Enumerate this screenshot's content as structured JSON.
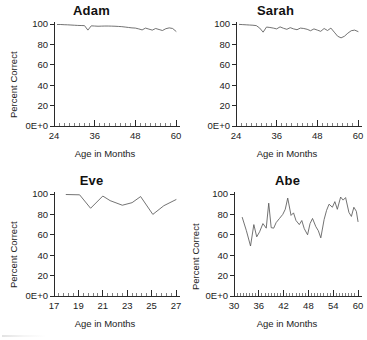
{
  "figure": {
    "title": "",
    "panel_count": 4
  },
  "chart_data": [
    {
      "type": "line",
      "title": "Adam",
      "xlabel": "Age in Months",
      "ylabel": "Percent Correct",
      "xlim": [
        24,
        60
      ],
      "ylim": [
        0,
        100
      ],
      "xticks": [
        24,
        36,
        48,
        60
      ],
      "xtick_labels": [
        "24",
        "36",
        "48",
        "60"
      ],
      "yticks": [
        0,
        20,
        40,
        60,
        80,
        100
      ],
      "ytick_labels": [
        "0E+0",
        "20",
        "40",
        "60",
        "80",
        "100"
      ],
      "x_minor_step": 1.5,
      "grid": false,
      "legend": "none",
      "x": [
        25,
        26,
        27,
        28,
        29,
        30,
        31,
        32,
        33,
        34,
        35,
        36,
        37,
        38,
        39,
        40,
        41,
        42,
        43,
        44,
        45,
        46,
        47,
        48,
        49,
        50,
        51,
        52,
        53,
        54,
        55,
        56,
        57,
        58,
        59,
        60
      ],
      "y": [
        99.5,
        99.5,
        99.3,
        99.2,
        99.0,
        98.8,
        98.6,
        98.5,
        98.4,
        94.0,
        98.2,
        98.0,
        97.8,
        97.9,
        98.0,
        98.0,
        97.9,
        97.8,
        97.6,
        97.4,
        97.0,
        96.6,
        96.2,
        96.0,
        95.2,
        94.2,
        96.0,
        95.0,
        94.0,
        95.6,
        94.6,
        93.6,
        95.4,
        96.2,
        95.6,
        92.8
      ],
      "series_name": "Adam"
    },
    {
      "type": "line",
      "title": "Sarah",
      "xlabel": "Age in Months",
      "ylabel": "",
      "xlim": [
        24,
        60
      ],
      "ylim": [
        0,
        100
      ],
      "xticks": [
        24,
        36,
        48,
        60
      ],
      "xtick_labels": [
        "24",
        "36",
        "48",
        "60"
      ],
      "yticks": [
        0,
        20,
        40,
        60,
        80,
        100
      ],
      "ytick_labels": [
        "0E+0",
        "20",
        "40",
        "60",
        "80",
        "100"
      ],
      "x_minor_step": 1.5,
      "grid": false,
      "legend": "none",
      "x": [
        25,
        26,
        27,
        28,
        29,
        30,
        31,
        32,
        33,
        34,
        35,
        36,
        37,
        38,
        39,
        40,
        41,
        42,
        43,
        44,
        45,
        46,
        47,
        48,
        49,
        50,
        51,
        52,
        53,
        54,
        55,
        56,
        57,
        58,
        59,
        60
      ],
      "y": [
        99.6,
        99.4,
        99.2,
        99.0,
        98.8,
        98.4,
        96.0,
        92.0,
        97.0,
        96.6,
        96.0,
        95.2,
        97.2,
        95.8,
        94.8,
        96.4,
        95.2,
        94.4,
        96.0,
        95.6,
        94.8,
        93.4,
        95.2,
        94.0,
        92.8,
        95.6,
        93.6,
        96.0,
        92.0,
        88.0,
        86.4,
        88.0,
        91.0,
        93.4,
        94.0,
        92.6
      ],
      "series_name": "Sarah"
    },
    {
      "type": "line",
      "title": "Eve",
      "xlabel": "Age in Months",
      "ylabel": "Percent Correct",
      "xlim": [
        17,
        27
      ],
      "ylim": [
        0,
        100
      ],
      "xticks": [
        17,
        19,
        21,
        23,
        25,
        27
      ],
      "xtick_labels": [
        "17",
        "19",
        "21",
        "23",
        "25",
        "27"
      ],
      "yticks": [
        0,
        20,
        40,
        60,
        80,
        100
      ],
      "ytick_labels": [
        "0E+0",
        "20",
        "40",
        "60",
        "80",
        "100"
      ],
      "x_minor_step": 0.4,
      "grid": false,
      "legend": "none",
      "x": [
        18.0,
        19.1,
        20.0,
        21.0,
        21.6,
        22.6,
        23.4,
        24.1,
        25.1,
        26.0,
        27.0
      ],
      "y": [
        99.5,
        99.2,
        86.0,
        98.0,
        93.5,
        89.0,
        91.5,
        97.5,
        80.0,
        88.5,
        94.5
      ],
      "series_name": "Eve"
    },
    {
      "type": "line",
      "title": "Abe",
      "xlabel": "Age in Months",
      "ylabel": "Percent Correct",
      "xlim": [
        30,
        60
      ],
      "ylim": [
        0,
        100
      ],
      "xticks": [
        30,
        36,
        42,
        48,
        54,
        60
      ],
      "xtick_labels": [
        "30",
        "36",
        "42",
        "48",
        "54",
        "60"
      ],
      "yticks": [
        0,
        20,
        40,
        60,
        80,
        100
      ],
      "ytick_labels": [
        "0E+0",
        "20",
        "40",
        "60",
        "80",
        "100"
      ],
      "x_minor_step": 0.75,
      "grid": false,
      "legend": "none",
      "x": [
        32.0,
        33.0,
        34.0,
        34.8,
        35.5,
        36.2,
        37.0,
        37.8,
        38.4,
        39.0,
        39.6,
        40.2,
        41.0,
        41.8,
        42.4,
        43.0,
        43.8,
        44.4,
        45.0,
        45.8,
        46.4,
        47.0,
        47.8,
        48.4,
        49.0,
        49.8,
        50.4,
        51.0,
        51.8,
        52.4,
        53.0,
        53.8,
        54.4,
        55.0,
        55.8,
        56.4,
        57.0,
        57.8,
        58.4,
        59.0,
        59.6,
        60.0
      ],
      "y": [
        77.0,
        64.0,
        49.0,
        70.0,
        58.0,
        63.0,
        71.0,
        66.5,
        91.0,
        67.0,
        66.5,
        72.0,
        76.0,
        80.0,
        85.0,
        96.0,
        79.0,
        81.5,
        74.0,
        70.0,
        74.0,
        66.0,
        60.0,
        71.0,
        76.0,
        68.0,
        64.0,
        57.0,
        75.0,
        84.0,
        90.0,
        87.0,
        92.5,
        85.0,
        97.0,
        94.0,
        96.5,
        82.0,
        78.0,
        87.0,
        83.0,
        73.0
      ],
      "series_name": "Abe"
    }
  ]
}
